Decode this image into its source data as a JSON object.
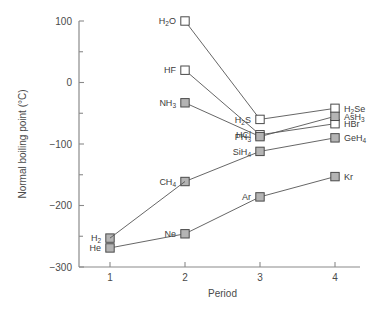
{
  "chart_data": {
    "type": "line",
    "title": "",
    "xlabel": "Period",
    "ylabel": "Normal boiling point (°C)",
    "xlim": [
      0.6,
      4.4
    ],
    "ylim": [
      -300,
      100
    ],
    "x": [
      1,
      2,
      3,
      4
    ],
    "xtick_labels": [
      "1",
      "2",
      "3",
      "4"
    ],
    "ytick_labels": [
      "100",
      "0",
      "-100",
      "-200",
      "-300"
    ],
    "ytick_values": [
      100,
      0,
      -100,
      -200,
      -300
    ],
    "yminor_values": [
      50,
      -50,
      -150,
      -250
    ],
    "grid": false,
    "legend": "none",
    "marker_open_color": "#ffffff",
    "marker_fill_color": "#b4b4b4",
    "line_color": "#555555",
    "axis_color": "#8a8a8a",
    "series": [
      {
        "name": "Group 16 hydrides",
        "marker": "open",
        "points": [
          {
            "x": 2,
            "y": 100,
            "label": "H2O",
            "label_html": "H<sub>2</sub>O",
            "label_pos": "left"
          },
          {
            "x": 3,
            "y": -60,
            "label": "H2S",
            "label_html": "H<sub>2</sub>S",
            "label_pos": "left"
          },
          {
            "x": 4,
            "y": -42,
            "label": "H2Se",
            "label_html": "H<sub>2</sub>Se",
            "label_pos": "right"
          }
        ]
      },
      {
        "name": "Group 17 hydrides",
        "marker": "open",
        "points": [
          {
            "x": 2,
            "y": 20,
            "label": "HF",
            "label_html": "HF",
            "label_pos": "left"
          },
          {
            "x": 3,
            "y": -85,
            "label": "HCl",
            "label_html": "HCl",
            "label_pos": "left"
          },
          {
            "x": 4,
            "y": -67,
            "label": "HBr",
            "label_html": "HBr",
            "label_pos": "right"
          }
        ]
      },
      {
        "name": "Group 15 hydrides",
        "marker": "fill",
        "points": [
          {
            "x": 2,
            "y": -33,
            "label": "NH3",
            "label_html": "NH<sub>3</sub>",
            "label_pos": "left"
          },
          {
            "x": 3,
            "y": -88,
            "label": "PH3",
            "label_html": "PH<sub>3</sub>",
            "label_pos": "left"
          },
          {
            "x": 4,
            "y": -55,
            "label": "AsH3",
            "label_html": "AsH<sub>3</sub>",
            "label_pos": "right"
          }
        ]
      },
      {
        "name": "Group 14 hydrides",
        "marker": "fill",
        "points": [
          {
            "x": 2,
            "y": -161,
            "label": "CH4",
            "label_html": "CH<sub>4</sub>",
            "label_pos": "left"
          },
          {
            "x": 3,
            "y": -112,
            "label": "SiH4",
            "label_html": "SiH<sub>4</sub>",
            "label_pos": "left"
          },
          {
            "x": 4,
            "y": -90,
            "label": "GeH4",
            "label_html": "GeH<sub>4</sub>",
            "label_pos": "right"
          }
        ]
      },
      {
        "name": "Noble gases",
        "marker": "fill",
        "points": [
          {
            "x": 1,
            "y": -269,
            "label": "He",
            "label_html": "He",
            "label_pos": "left"
          },
          {
            "x": 2,
            "y": -246,
            "label": "Ne",
            "label_html": "Ne",
            "label_pos": "left"
          },
          {
            "x": 3,
            "y": -186,
            "label": "Ar",
            "label_html": "Ar",
            "label_pos": "left"
          },
          {
            "x": 4,
            "y": -153,
            "label": "Kr",
            "label_html": "Kr",
            "label_pos": "right"
          }
        ]
      },
      {
        "name": "Hydrogen",
        "marker": "fill",
        "points": [
          {
            "x": 1,
            "y": -253,
            "label": "H2",
            "label_html": "H<sub>2</sub>",
            "label_pos": "left"
          }
        ]
      }
    ],
    "connections": [
      {
        "from": {
          "x": 1,
          "y": -253
        },
        "to": {
          "x": 2,
          "y": -161
        }
      }
    ]
  }
}
